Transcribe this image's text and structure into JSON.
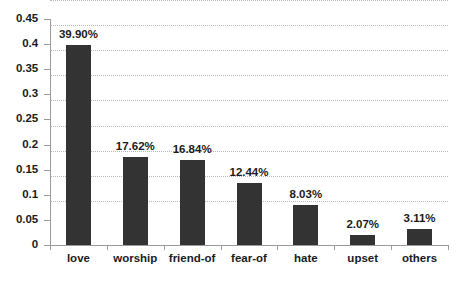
{
  "chart_data": {
    "type": "bar",
    "title": "",
    "subtitle": "",
    "xlabel": "",
    "ylabel": "",
    "categories": [
      "love",
      "worship",
      "friend-of",
      "fear-of",
      "hate",
      "upset",
      "others"
    ],
    "values": [
      0.399,
      0.1762,
      0.1684,
      0.1244,
      0.0803,
      0.0207,
      0.0311
    ],
    "data_labels": [
      "39.90%",
      "17.62%",
      "16.84%",
      "12.44%",
      "8.03%",
      "2.07%",
      "3.11%"
    ],
    "ylim": [
      0,
      0.45
    ],
    "ytick_labels": [
      "0",
      "0.05",
      "0.1",
      "0.15",
      "0.2",
      "0.25",
      "0.3",
      "0.35",
      "0.4",
      "0.45"
    ],
    "ytick_values": [
      0,
      0.05,
      0.1,
      0.15,
      0.2,
      0.25,
      0.3,
      0.35,
      0.4,
      0.45
    ],
    "grid": true,
    "grid_axis": "y",
    "legend": false,
    "legend_position": "none",
    "series": [
      {
        "name": "",
        "values": [
          0.399,
          0.1762,
          0.1684,
          0.1244,
          0.0803,
          0.0207,
          0.0311
        ]
      }
    ],
    "colors": {
      "bar": "#333333",
      "gridline": "#b9b9b9",
      "axis": "#9a9a9a",
      "text": "#1b1b1b",
      "background": "#ffffff"
    }
  }
}
